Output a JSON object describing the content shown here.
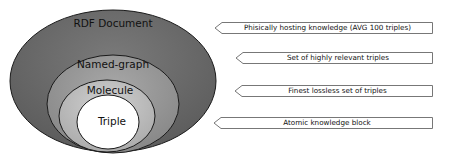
{
  "layers": [
    {
      "name": "RDF Document",
      "fill": "#6e6e6e"
    },
    {
      "name": "Named-graph",
      "fill": "#9a9a9a"
    },
    {
      "name": "Molecule",
      "fill": "#c2c2c2"
    },
    {
      "name": "Triple",
      "fill": "#ffffff"
    }
  ],
  "callouts": [
    {
      "text": "Phisically hosting knowledge (AVG 100 triples)"
    },
    {
      "text": "Set of highly relevant triples"
    },
    {
      "text": "Finest lossless set of triples"
    },
    {
      "text": "Atomic knowledge block"
    }
  ]
}
